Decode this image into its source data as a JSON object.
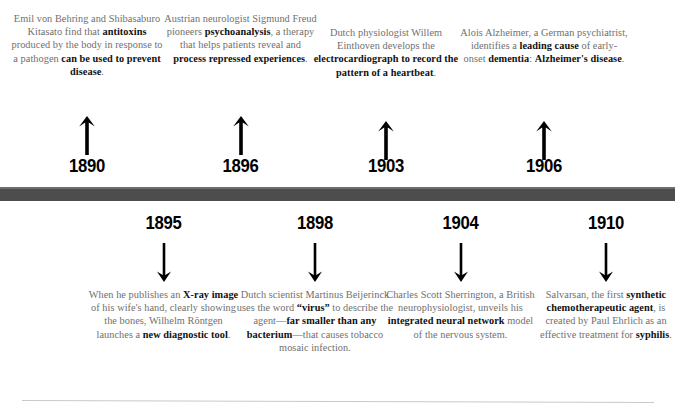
{
  "theme": {
    "bar_color": "#4d4d4d",
    "bar_highlight": "#6e6e6e",
    "body_text_color": "#6f6f6f",
    "emphasis_text_color": "#111111",
    "year_color": "#000000",
    "rule_color": "#c9c9c9",
    "background": "#ffffff"
  },
  "timeline": {
    "events_above": [
      {
        "year": "1890",
        "arrow": "arrow-up-icon",
        "segments": [
          {
            "text": "Emil von Behring and Shibasaburo Kitasato find that ",
            "bold": false
          },
          {
            "text": "antitoxins",
            "bold": true
          },
          {
            "text": " produced by the body in response to a pathogen ",
            "bold": false
          },
          {
            "text": "can be used to prevent disease",
            "bold": true
          },
          {
            "text": ".",
            "bold": false
          }
        ],
        "plain_text": "Emil von Behring and Shibasaburo Kitasato find that antitoxins produced by the body in response to a pathogen can be used to prevent disease."
      },
      {
        "year": "1896",
        "arrow": "arrow-up-icon",
        "segments": [
          {
            "text": "Austrian neurologist Sigmund Freud pioneers ",
            "bold": false
          },
          {
            "text": "psychoanalysis",
            "bold": true
          },
          {
            "text": ", a therapy that helps patients reveal and ",
            "bold": false
          },
          {
            "text": "process repressed experiences",
            "bold": true
          },
          {
            "text": ".",
            "bold": false
          }
        ],
        "plain_text": "Austrian neurologist Sigmund Freud pioneers psychoanalysis, a therapy that helps patients reveal and process repressed experiences."
      },
      {
        "year": "1903",
        "arrow": "arrow-up-icon",
        "segments": [
          {
            "text": "Dutch physiologist Willem Einthoven develops the ",
            "bold": false
          },
          {
            "text": "electrocardiograph to record the pattern of a heartbeat",
            "bold": true
          },
          {
            "text": ".",
            "bold": false
          }
        ],
        "plain_text": "Dutch physiologist Willem Einthoven develops the electrocardiograph to record the pattern of a heartbeat."
      },
      {
        "year": "1906",
        "arrow": "arrow-up-icon",
        "segments": [
          {
            "text": "Alois Alzheimer, a German psychiatrist, identifies a ",
            "bold": false
          },
          {
            "text": "leading cause",
            "bold": true
          },
          {
            "text": " of early-onset ",
            "bold": false
          },
          {
            "text": "dementia",
            "bold": true
          },
          {
            "text": ": ",
            "bold": false
          },
          {
            "text": "Alzheimer's disease",
            "bold": true
          },
          {
            "text": ".",
            "bold": false
          }
        ],
        "plain_text": "Alois Alzheimer, a German psychiatrist, identifies a leading cause of early-onset dementia: Alzheimer's disease."
      }
    ],
    "events_below": [
      {
        "year": "1895",
        "arrow": "arrow-down-icon",
        "segments": [
          {
            "text": "When he publishes an ",
            "bold": false
          },
          {
            "text": "X-ray image",
            "bold": true
          },
          {
            "text": " of his wife's hand, clearly showing the bones, Wilhelm Röntgen launches a ",
            "bold": false
          },
          {
            "text": "new diagnostic tool",
            "bold": true
          },
          {
            "text": ".",
            "bold": false
          }
        ],
        "plain_text": "When he publishes an X-ray image of his wife's hand, clearly showing the bones, Wilhelm Röntgen launches a new diagnostic tool."
      },
      {
        "year": "1898",
        "arrow": "arrow-down-icon",
        "segments": [
          {
            "text": "Dutch scientist Martinus Beijerinck uses the word ",
            "bold": false
          },
          {
            "text": "“virus”",
            "bold": true
          },
          {
            "text": " to describe the agent—",
            "bold": false
          },
          {
            "text": "far smaller than any bacterium",
            "bold": true
          },
          {
            "text": "—that causes tobacco mosaic infection.",
            "bold": false
          }
        ],
        "plain_text": "Dutch scientist Martinus Beijerinck uses the word “virus” to describe the agent—far smaller than any bacterium—that causes tobacco mosaic infection."
      },
      {
        "year": "1904",
        "arrow": "arrow-down-icon",
        "segments": [
          {
            "text": "Charles Scott Sherrington, a British neurophysiologist, unveils his ",
            "bold": false
          },
          {
            "text": "integrated neural network",
            "bold": true
          },
          {
            "text": " model of the nervous system.",
            "bold": false
          }
        ],
        "plain_text": "Charles Scott Sherrington, a British neurophysiologist, unveils his integrated neural network model of the nervous system."
      },
      {
        "year": "1910",
        "arrow": "arrow-down-icon",
        "segments": [
          {
            "text": "Salvarsan, the first ",
            "bold": false
          },
          {
            "text": "synthetic chemotherapeutic agent",
            "bold": true
          },
          {
            "text": ", is created by Paul Ehrlich as an effective treatment for ",
            "bold": false
          },
          {
            "text": "syphilis",
            "bold": true
          },
          {
            "text": ".",
            "bold": false
          }
        ],
        "plain_text": "Salvarsan, the first synthetic chemotherapeutic agent, is created by Paul Ehrlich as an effective treatment for syphilis."
      }
    ]
  },
  "layout": {
    "above_columns": [
      {
        "left": 8,
        "width": 158,
        "blurb_top": 12,
        "arrow_top": 115,
        "year_top": 155
      },
      {
        "left": 163,
        "width": 155,
        "blurb_top": 12,
        "arrow_top": 115,
        "year_top": 155
      },
      {
        "left": 310,
        "width": 152,
        "blurb_top": 26,
        "arrow_top": 120,
        "year_top": 155
      },
      {
        "left": 460,
        "width": 168,
        "blurb_top": 26,
        "arrow_top": 120,
        "year_top": 155
      }
    ],
    "below_columns": [
      {
        "left": 86,
        "width": 155,
        "year_top": 212,
        "arrow_top": 243,
        "blurb_top": 288
      },
      {
        "left": 236,
        "width": 158,
        "year_top": 212,
        "arrow_top": 243,
        "blurb_top": 288
      },
      {
        "left": 383,
        "width": 155,
        "year_top": 212,
        "arrow_top": 243,
        "blurb_top": 288
      },
      {
        "left": 536,
        "width": 140,
        "year_top": 212,
        "arrow_top": 243,
        "blurb_top": 288
      }
    ]
  }
}
